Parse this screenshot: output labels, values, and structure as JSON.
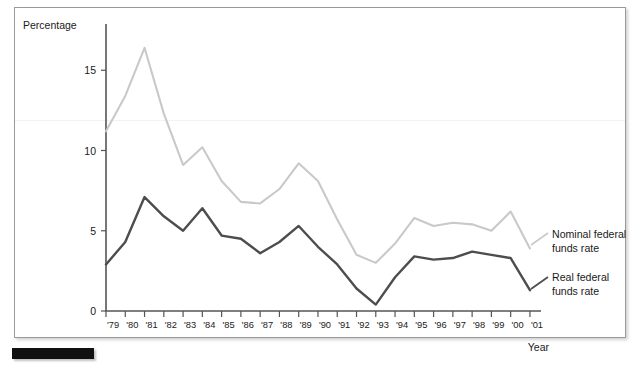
{
  "figure": {
    "name": "federal-funds-rate-line-chart",
    "ylabel": "Percentage",
    "xlabel": "Year",
    "colors": {
      "nominal": "#c9c9c9",
      "real": "#4d4d4d",
      "axis": "#555555",
      "frame": "#9a9a9a",
      "marker_bar": "#111111"
    }
  },
  "legend": {
    "nominal_line1": "Nominal federal",
    "nominal_line2": "funds rate",
    "real_line1": "Real federal",
    "real_line2": "funds rate"
  },
  "chart_data": {
    "type": "line",
    "title": "",
    "xlabel": "Year",
    "ylabel": "Percentage",
    "xlim": [
      1979,
      2001
    ],
    "ylim": [
      0,
      17.5
    ],
    "yticks": [
      0,
      5,
      10,
      15
    ],
    "ytick_labels": [
      "0",
      "5",
      "10",
      "15"
    ],
    "grid": false,
    "legend_position": "right",
    "categories": [
      "'79",
      "'80",
      "'81",
      "'82",
      "'83",
      "'84",
      "'85",
      "'86",
      "'87",
      "'88",
      "'89",
      "'90",
      "'91",
      "'92",
      "'93",
      "'94",
      "'95",
      "'96",
      "'97",
      "'98",
      "'99",
      "'00",
      "'01"
    ],
    "x": [
      1979,
      1980,
      1981,
      1982,
      1983,
      1984,
      1985,
      1986,
      1987,
      1988,
      1989,
      1990,
      1991,
      1992,
      1993,
      1994,
      1995,
      1996,
      1997,
      1998,
      1999,
      2000,
      2001
    ],
    "series": [
      {
        "name": "Nominal federal funds rate",
        "color": "#c9c9c9",
        "values": [
          11.2,
          13.4,
          16.4,
          12.3,
          9.1,
          10.2,
          8.1,
          6.8,
          6.7,
          7.6,
          9.2,
          8.1,
          5.7,
          3.5,
          3.0,
          4.2,
          5.8,
          5.3,
          5.5,
          5.4,
          5.0,
          6.2,
          3.9
        ]
      },
      {
        "name": "Real federal funds rate",
        "color": "#4d4d4d",
        "values": [
          2.9,
          4.3,
          7.1,
          5.9,
          5.0,
          6.4,
          4.7,
          4.5,
          3.6,
          4.3,
          5.3,
          4.0,
          2.9,
          1.4,
          0.4,
          2.1,
          3.4,
          3.2,
          3.3,
          3.7,
          3.5,
          3.3,
          1.3
        ]
      }
    ]
  }
}
